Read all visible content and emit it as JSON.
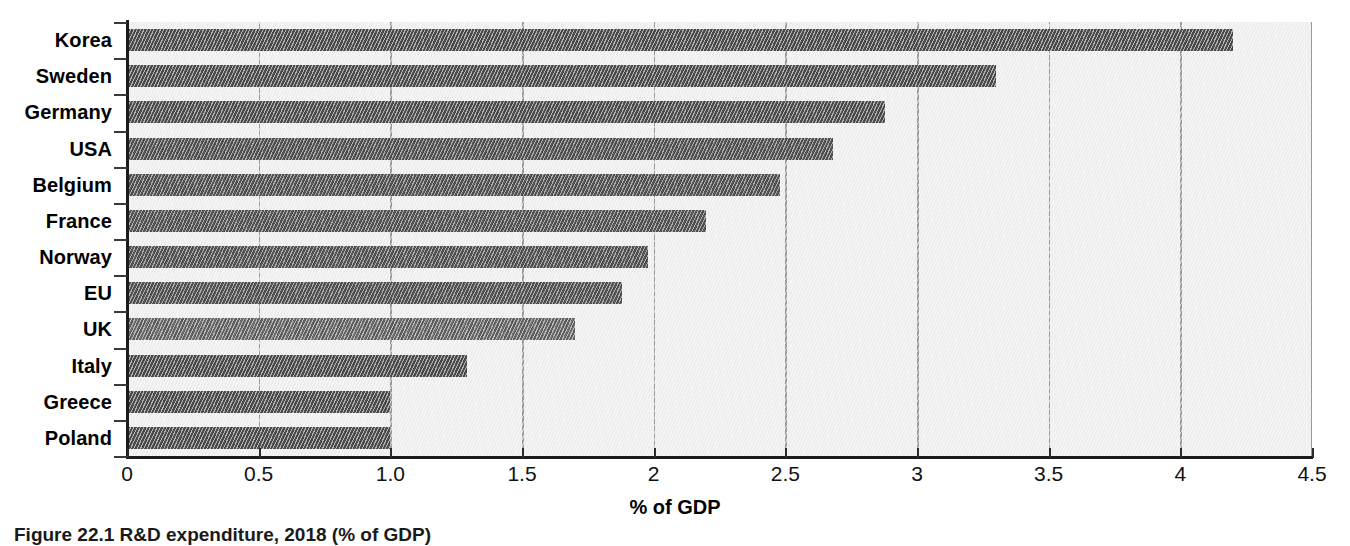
{
  "figure": {
    "caption": "Figure 22.1 R&D expenditure, 2018 (% of GDP)",
    "axis_title_x": "% of GDP"
  },
  "chart_data": {
    "type": "bar",
    "orientation": "horizontal",
    "title": "",
    "xlabel": "% of GDP",
    "ylabel": "",
    "xlim": [
      0,
      4.5
    ],
    "grid": true,
    "grid_axis": "x",
    "legend": false,
    "bar_color": "#4a4a4a",
    "highlight_color": "#5d5d5d",
    "plot_background": "#eeeeee",
    "categories": [
      "Korea",
      "Sweden",
      "Germany",
      "USA",
      "Belgium",
      "France",
      "Norway",
      "EU",
      "UK",
      "Italy",
      "Greece",
      "Poland"
    ],
    "values": [
      4.2,
      3.3,
      2.88,
      2.68,
      2.48,
      2.2,
      1.98,
      1.88,
      1.7,
      1.29,
      1.0,
      1.0
    ],
    "highlighted_category": "UK",
    "xticks": [
      0,
      0.5,
      1.0,
      1.5,
      2,
      2.5,
      3,
      3.5,
      4,
      4.5
    ],
    "xtick_labels": [
      "0",
      "0.5",
      "1.0",
      "1.5",
      "2",
      "2.5",
      "3",
      "3.5",
      "4",
      "4.5"
    ]
  }
}
